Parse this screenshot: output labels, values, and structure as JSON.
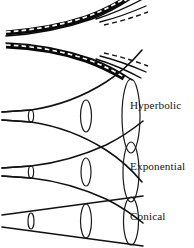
{
  "figure": {
    "background_color": "#ffffff",
    "line_color": "#111111",
    "width": 194,
    "height": 248
  },
  "labels": [
    {
      "text": "Hyperbolic",
      "x": 130,
      "y": 100
    },
    {
      "text": "Exponential",
      "x": 130,
      "y": 161
    },
    {
      "text": "Conical",
      "x": 130,
      "y": 211
    }
  ],
  "horns": [
    {
      "name": "hyperbolic",
      "label": "Hyperbolic",
      "flare_type": "hyperbolic",
      "axis_y": 116,
      "throat_x": 2,
      "throat_half_height": 4,
      "mouth_x": 137,
      "mouth_half_height": 42,
      "sections": [
        {
          "x": 31,
          "half_height": 6
        },
        {
          "x": 86,
          "half_height": 16
        },
        {
          "x": 131,
          "half_height": 37
        }
      ]
    },
    {
      "name": "exponential",
      "label": "Exponential",
      "flare_type": "exponential",
      "axis_y": 172,
      "throat_x": 2,
      "throat_half_height": 4,
      "mouth_x": 137,
      "mouth_half_height": 33,
      "sections": [
        {
          "x": 31,
          "half_height": 6
        },
        {
          "x": 86,
          "half_height": 14
        },
        {
          "x": 131,
          "half_height": 30
        }
      ]
    },
    {
      "name": "conical",
      "label": "Conical",
      "flare_type": "conical",
      "axis_y": 221,
      "throat_x": 2,
      "throat_half_height": 4,
      "mouth_x": 137,
      "mouth_half_height": 25,
      "sections": [
        {
          "x": 31,
          "half_height": 8
        },
        {
          "x": 86,
          "half_height": 17
        },
        {
          "x": 131,
          "half_height": 24
        }
      ]
    }
  ],
  "top_bands": [
    {
      "name": "upper-flare-band",
      "description": "upper horn wall with overlaid dashed profile",
      "curve_direction": "up-right"
    },
    {
      "name": "lower-flare-band",
      "description": "lower horn wall with overlaid dashed profile",
      "curve_direction": "down-right"
    }
  ]
}
